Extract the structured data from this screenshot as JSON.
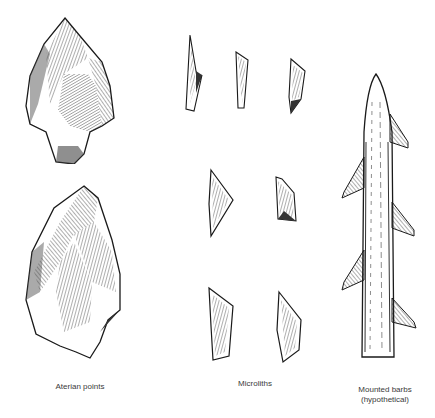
{
  "figure": {
    "groups": [
      {
        "id": "aterian",
        "label": "Aterian points",
        "count": 2
      },
      {
        "id": "microliths",
        "label": "Microliths",
        "count": 7
      },
      {
        "id": "barbs",
        "label_line1": "Mounted barbs",
        "label_line2": "(hypothetical)"
      }
    ]
  },
  "colors": {
    "ink": "#1a1a1a",
    "background": "#ffffff",
    "label": "#3a3a3a"
  }
}
